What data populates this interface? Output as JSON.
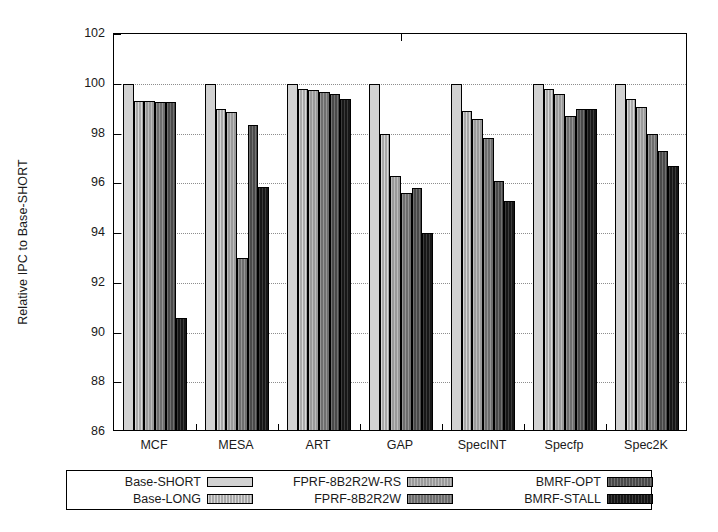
{
  "chart_data": {
    "type": "bar",
    "title": "",
    "xlabel": "",
    "ylabel": "Relative IPC to Base-SHORT",
    "ylim": [
      86,
      102
    ],
    "yticks": [
      86,
      88,
      90,
      92,
      94,
      96,
      98,
      100,
      102
    ],
    "ytick_labels": [
      "86",
      "88",
      "90",
      "92",
      "94",
      "96",
      "98",
      "100",
      "102"
    ],
    "grid": true,
    "legend_position": "bottom",
    "categories": [
      "MCF",
      "MESA",
      "ART",
      "GAP",
      "SpecINT",
      "Specfp",
      "Spec2K"
    ],
    "series": [
      {
        "name": "Base-SHORT",
        "color": "#d2d2d2",
        "values": [
          100.0,
          100.0,
          100.0,
          100.0,
          100.0,
          100.0,
          100.0
        ]
      },
      {
        "name": "Base-LONG",
        "color": "#a8a8a8",
        "values": [
          99.3,
          99.0,
          99.8,
          98.0,
          98.9,
          99.8,
          99.4
        ]
      },
      {
        "name": "FPRF-8B2R2W-RS",
        "color": "#9a9a9a",
        "values": [
          99.3,
          98.85,
          99.75,
          96.3,
          98.6,
          99.6,
          99.05
        ]
      },
      {
        "name": "FPRF-8B2R2W",
        "color": "#6e6e6e",
        "values": [
          99.25,
          93.0,
          99.65,
          95.6,
          97.8,
          98.7,
          98.0
        ]
      },
      {
        "name": "BMRF-OPT",
        "color": "#4a4a4a",
        "values": [
          99.25,
          98.35,
          99.6,
          95.8,
          96.1,
          99.0,
          97.3
        ]
      },
      {
        "name": "BMRF-STALL",
        "color": "#171717",
        "values": [
          90.6,
          95.85,
          99.4,
          94.0,
          95.3,
          99.0,
          96.7
        ]
      }
    ]
  },
  "legend": {
    "columns": [
      {
        "entries": [
          {
            "label": "Base-SHORT",
            "series_index": 0
          },
          {
            "label": "Base-LONG",
            "series_index": 1
          }
        ]
      },
      {
        "entries": [
          {
            "label": "FPRF-8B2R2W-RS",
            "series_index": 2
          },
          {
            "label": "FPRF-8B2R2W",
            "series_index": 3
          }
        ]
      },
      {
        "entries": [
          {
            "label": "BMRF-OPT",
            "series_index": 4
          },
          {
            "label": "BMRF-STALL",
            "series_index": 5
          }
        ]
      }
    ]
  }
}
